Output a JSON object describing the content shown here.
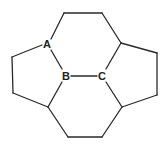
{
  "diagram": {
    "labels": {
      "A": "A",
      "B": "B",
      "C": "C"
    },
    "colors": {
      "line": "#2a2a2a",
      "text": "#222222",
      "background": "#ffffff"
    }
  }
}
